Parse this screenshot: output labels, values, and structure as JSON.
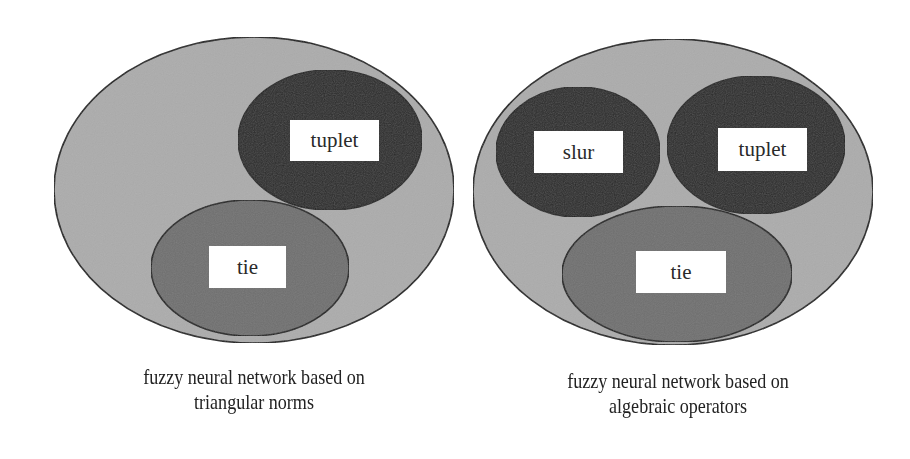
{
  "colors": {
    "outer_fill": "#acacac",
    "dark_fill": "#2c2c2c",
    "medium_fill": "#6f6f6f",
    "stroke": "#1e1e1e",
    "label_bg": "#ffffff",
    "background": "#ffffff"
  },
  "diagrams": [
    {
      "id": "left",
      "caption_line1": "fuzzy neural network based on",
      "caption_line2": "triangular norms",
      "outer": {
        "cx": 254,
        "cy": 190,
        "rx": 200,
        "ry": 153
      },
      "sets": [
        {
          "label": "tuplet",
          "shade": "dark",
          "cx": 330,
          "cy": 140,
          "rx": 92,
          "ry": 70,
          "box": {
            "x": 290,
            "y": 120,
            "w": 89,
            "h": 41
          }
        },
        {
          "label": "tie",
          "shade": "medium",
          "cx": 250,
          "cy": 268,
          "rx": 99,
          "ry": 68,
          "box": {
            "x": 209,
            "y": 246,
            "w": 77,
            "h": 42
          }
        }
      ]
    },
    {
      "id": "right",
      "caption_line1": "fuzzy neural network based on",
      "caption_line2": "algebraic operators",
      "outer": {
        "cx": 673,
        "cy": 192,
        "rx": 200,
        "ry": 153
      },
      "sets": [
        {
          "label": "slur",
          "shade": "dark",
          "cx": 578,
          "cy": 152,
          "rx": 82,
          "ry": 65,
          "box": {
            "x": 534,
            "y": 131,
            "w": 89,
            "h": 42
          }
        },
        {
          "label": "tuplet",
          "shade": "dark",
          "cx": 756,
          "cy": 145,
          "rx": 89,
          "ry": 69,
          "box": {
            "x": 718,
            "y": 128,
            "w": 89,
            "h": 43
          }
        },
        {
          "label": "tie",
          "shade": "medium",
          "cx": 677,
          "cy": 274,
          "rx": 115,
          "ry": 68,
          "box": {
            "x": 636,
            "y": 251,
            "w": 90,
            "h": 42
          }
        }
      ]
    }
  ]
}
